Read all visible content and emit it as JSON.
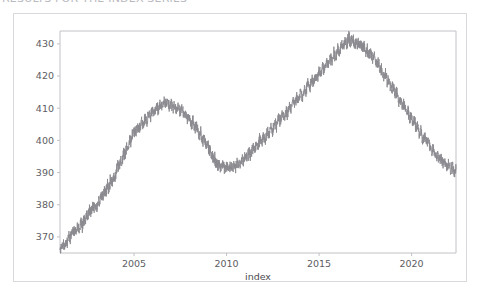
{
  "header": {
    "clipped_text": "RESULTS FOR THE INDEX SERIES"
  },
  "figure": {
    "background": "#ffffff",
    "border_color": "#d9d9dd"
  },
  "chart_data": {
    "type": "line",
    "title": "",
    "xlabel": "index",
    "ylabel": "",
    "xlim": [
      2001.0,
      2022.4
    ],
    "ylim": [
      365.0,
      434.0
    ],
    "grid": false,
    "legend": null,
    "line_color": "#8a8a90",
    "line_width": 0.9,
    "xticks": [
      2005,
      2010,
      2015,
      2020
    ],
    "xtick_labels": [
      "2005",
      "2010",
      "2015",
      "2020"
    ],
    "yticks": [
      370,
      380,
      390,
      400,
      410,
      420,
      430
    ],
    "ytick_labels": [
      "370",
      "380",
      "390",
      "400",
      "410",
      "420",
      "430"
    ],
    "series": [
      {
        "name": "index",
        "x": [
          2001.0,
          2001.08,
          2001.16,
          2001.24,
          2001.32,
          2001.4,
          2001.48,
          2001.56,
          2001.64,
          2001.72,
          2001.8,
          2001.88,
          2001.96,
          2002.04,
          2002.12,
          2002.2,
          2002.28,
          2002.36,
          2002.44,
          2002.52,
          2002.6,
          2002.68,
          2002.76,
          2002.84,
          2002.92,
          2003.0,
          2003.08,
          2003.16,
          2003.24,
          2003.32,
          2003.4,
          2003.48,
          2003.56,
          2003.64,
          2003.72,
          2003.8,
          2003.88,
          2003.96,
          2004.04,
          2004.12,
          2004.2,
          2004.28,
          2004.36,
          2004.44,
          2004.52,
          2004.6,
          2004.68,
          2004.76,
          2004.84,
          2004.92,
          2005.0,
          2005.1,
          2005.2,
          2005.3,
          2005.4,
          2005.5,
          2005.6,
          2005.7,
          2005.8,
          2005.9,
          2006.0,
          2006.1,
          2006.2,
          2006.3,
          2006.4,
          2006.5,
          2006.6,
          2006.7,
          2006.8,
          2006.9,
          2007.0,
          2007.1,
          2007.2,
          2007.3,
          2007.4,
          2007.5,
          2007.6,
          2007.7,
          2007.8,
          2007.9,
          2008.0,
          2008.1,
          2008.2,
          2008.3,
          2008.4,
          2008.5,
          2008.6,
          2008.7,
          2008.8,
          2008.9,
          2009.0,
          2009.06,
          2009.12,
          2009.18,
          2009.24,
          2009.3,
          2009.36,
          2009.42,
          2009.48,
          2009.54,
          2009.6,
          2009.7,
          2009.8,
          2009.9,
          2010.0,
          2010.1,
          2010.2,
          2010.3,
          2010.4,
          2010.5,
          2010.6,
          2010.7,
          2010.8,
          2010.9,
          2011.0,
          2011.1,
          2011.2,
          2011.3,
          2011.4,
          2011.5,
          2011.6,
          2011.7,
          2011.8,
          2011.9,
          2012.0,
          2012.1,
          2012.2,
          2012.3,
          2012.4,
          2012.5,
          2012.6,
          2012.7,
          2012.8,
          2012.9,
          2013.0,
          2013.1,
          2013.2,
          2013.3,
          2013.4,
          2013.5,
          2013.6,
          2013.7,
          2013.8,
          2013.9,
          2014.0,
          2014.1,
          2014.2,
          2014.3,
          2014.4,
          2014.5,
          2014.6,
          2014.7,
          2014.8,
          2014.9,
          2015.0,
          2015.1,
          2015.2,
          2015.3,
          2015.4,
          2015.5,
          2015.6,
          2015.7,
          2015.8,
          2015.9,
          2016.0,
          2016.1,
          2016.2,
          2016.3,
          2016.4,
          2016.5,
          2016.6,
          2016.7,
          2016.8,
          2016.9,
          2017.0,
          2017.1,
          2017.2,
          2017.3,
          2017.4,
          2017.5,
          2017.6,
          2017.7,
          2017.8,
          2017.9,
          2018.0,
          2018.1,
          2018.2,
          2018.3,
          2018.4,
          2018.5,
          2018.6,
          2018.7,
          2018.8,
          2018.9,
          2019.0,
          2019.1,
          2019.2,
          2019.3,
          2019.4,
          2019.5,
          2019.6,
          2019.7,
          2019.8,
          2019.9,
          2020.0,
          2020.08,
          2020.16,
          2020.24,
          2020.32,
          2020.4,
          2020.5,
          2020.6,
          2020.7,
          2020.8,
          2020.9,
          2021.0,
          2021.1,
          2021.2,
          2021.3,
          2021.4,
          2021.5,
          2021.6,
          2021.7,
          2021.8,
          2021.9,
          2022.0,
          2022.1,
          2022.2,
          2022.3,
          2022.4
        ],
        "values": [
          367.2,
          366.6,
          368.4,
          367.0,
          369.3,
          368.1,
          370.6,
          369.4,
          371.8,
          370.9,
          372.6,
          371.5,
          373.4,
          372.0,
          374.6,
          373.2,
          375.8,
          374.4,
          377.2,
          376.0,
          378.6,
          377.4,
          379.8,
          378.6,
          380.4,
          379.2,
          381.6,
          380.4,
          383.0,
          382.0,
          384.6,
          383.4,
          386.2,
          385.0,
          387.6,
          386.4,
          388.8,
          388.0,
          390.6,
          392.4,
          391.2,
          394.0,
          393.0,
          396.2,
          395.0,
          398.4,
          397.2,
          400.6,
          399.4,
          401.8,
          403.0,
          402.0,
          404.6,
          403.4,
          405.8,
          404.6,
          407.2,
          406.0,
          408.4,
          407.2,
          409.6,
          408.4,
          410.8,
          409.6,
          411.4,
          410.2,
          412.6,
          411.4,
          412.0,
          410.6,
          411.8,
          410.4,
          411.0,
          409.6,
          410.4,
          408.8,
          409.6,
          407.8,
          408.6,
          406.4,
          407.2,
          405.0,
          406.0,
          403.4,
          404.4,
          401.6,
          402.6,
          399.8,
          400.8,
          398.0,
          399.0,
          396.4,
          397.4,
          395.0,
          396.0,
          393.6,
          394.6,
          392.4,
          393.4,
          391.8,
          392.8,
          391.4,
          392.4,
          391.0,
          392.2,
          390.8,
          392.0,
          391.2,
          392.6,
          391.6,
          393.4,
          392.4,
          394.2,
          393.2,
          395.0,
          394.0,
          396.4,
          395.2,
          397.8,
          396.6,
          399.2,
          398.0,
          400.6,
          399.2,
          401.4,
          400.0,
          402.8,
          401.4,
          404.2,
          402.8,
          405.6,
          404.2,
          407.0,
          405.6,
          408.2,
          406.8,
          409.6,
          408.2,
          411.0,
          409.6,
          412.4,
          411.0,
          413.8,
          412.4,
          415.0,
          413.6,
          416.4,
          415.0,
          417.8,
          416.4,
          419.0,
          417.6,
          420.4,
          419.0,
          421.8,
          420.4,
          423.0,
          421.6,
          424.4,
          423.0,
          425.8,
          424.4,
          427.0,
          425.6,
          428.4,
          427.0,
          429.8,
          428.4,
          431.2,
          429.8,
          432.0,
          430.6,
          431.4,
          430.0,
          431.0,
          429.6,
          430.4,
          428.8,
          429.6,
          427.8,
          428.6,
          426.4,
          427.2,
          425.0,
          426.0,
          423.4,
          424.4,
          421.6,
          422.6,
          419.8,
          420.8,
          417.8,
          418.8,
          415.8,
          416.8,
          414.0,
          415.0,
          412.2,
          413.2,
          410.4,
          411.4,
          408.6,
          409.6,
          407.0,
          408.0,
          405.2,
          406.2,
          403.4,
          404.4,
          402.0,
          403.0,
          400.6,
          401.6,
          399.2,
          400.2,
          398.0,
          396.4,
          397.4,
          395.0,
          396.0,
          393.6,
          394.6,
          392.4,
          393.4,
          391.6,
          392.6,
          390.8,
          391.8,
          390.0,
          391.0
        ]
      }
    ],
    "annotations": []
  }
}
